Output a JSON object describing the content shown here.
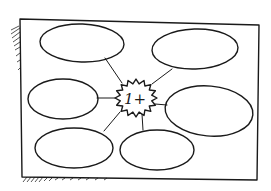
{
  "diagram": {
    "type": "cluster-map",
    "style": "hand-drawn sketch",
    "ink_color": "#1a1a1a",
    "background": "#ffffff",
    "center": {
      "label": "1+",
      "shape": "starburst"
    },
    "nodes": [
      {
        "id": "top-left",
        "label": ""
      },
      {
        "id": "top-right",
        "label": ""
      },
      {
        "id": "middle-left",
        "label": ""
      },
      {
        "id": "middle-right",
        "label": ""
      },
      {
        "id": "bottom-left",
        "label": ""
      },
      {
        "id": "bottom-center",
        "label": ""
      }
    ],
    "connections": [
      {
        "from": "center",
        "to": "top-left"
      },
      {
        "from": "center",
        "to": "top-right"
      },
      {
        "from": "center",
        "to": "middle-left"
      },
      {
        "from": "center",
        "to": "middle-right"
      },
      {
        "from": "center",
        "to": "bottom-left"
      },
      {
        "from": "center",
        "to": "bottom-center"
      }
    ]
  }
}
